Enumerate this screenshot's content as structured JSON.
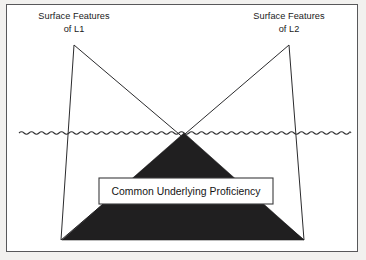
{
  "figure": {
    "background_color": "#f2f1ef",
    "canvas_color": "#ffffff",
    "frame_border_color": "#58585a",
    "ink_color": "#201f20"
  },
  "labels": {
    "left": {
      "line1": "Surface Features",
      "line2": "of L1"
    },
    "right": {
      "line1": "Surface Features",
      "line2": "of L2"
    },
    "center_box": {
      "text": "Common Underlying Proficiency",
      "fill_color": "#ffffff",
      "border_color": "#3b3b3d"
    }
  },
  "diagram_data": {
    "type": "diagram",
    "waterline": {
      "name": "surface-waterline",
      "y": 133,
      "x_start": 19,
      "x_end": 351,
      "wave_period": 10,
      "wave_amplitude": 2.4,
      "style": "wavy"
    },
    "left_peak": {
      "name": "left-surface-triangle",
      "apex_x": 74,
      "apex_y": 45,
      "base_left_x": 61,
      "base_right_x": 304,
      "base_y": 240
    },
    "right_peak": {
      "name": "right-surface-triangle",
      "apex_x": 289,
      "apex_y": 45,
      "base_left_x": 61,
      "base_right_x": 304,
      "base_y": 240
    },
    "submerged_mass": {
      "name": "common-underlying-proficiency-mass",
      "apex_x": 184,
      "apex_y": 133,
      "base_left_x": 62,
      "base_right_x": 304,
      "base_y": 240,
      "fill": "#201f20"
    },
    "center_box_bounds": {
      "x": 99,
      "y": 178,
      "width": 174,
      "height": 26
    }
  }
}
